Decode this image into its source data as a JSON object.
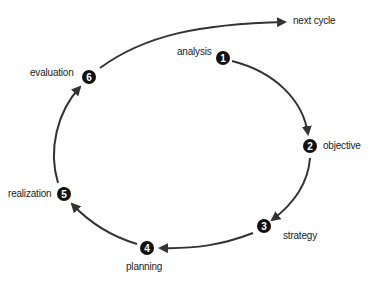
{
  "diagram": {
    "type": "cycle",
    "stroke_color": "#333333",
    "node_fill": "#111111",
    "node_text_color": "#ffffff",
    "nodes": [
      {
        "number": "1",
        "label": "analysis"
      },
      {
        "number": "2",
        "label": "objective"
      },
      {
        "number": "3",
        "label": "strategy"
      },
      {
        "number": "4",
        "label": "planning"
      },
      {
        "number": "5",
        "label": "realization"
      },
      {
        "number": "6",
        "label": "evaluation"
      }
    ],
    "exit_label": "next cycle",
    "edges": [
      {
        "from": "1",
        "to": "2"
      },
      {
        "from": "2",
        "to": "3"
      },
      {
        "from": "3",
        "to": "4"
      },
      {
        "from": "4",
        "to": "5"
      },
      {
        "from": "5",
        "to": "6"
      },
      {
        "from": "6",
        "to": "next cycle"
      }
    ]
  }
}
